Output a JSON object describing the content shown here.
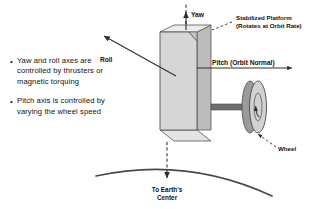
{
  "diagram": {
    "bullets": [
      {
        "marker": "•",
        "text": "Yaw and roll axes are controlled by thrusters or magnetic torquing"
      },
      {
        "marker": "•",
        "text": "Pitch axis is controlled by varying the wheel speed"
      }
    ],
    "axis_labels": {
      "yaw": "Yaw",
      "roll": "Roll",
      "pitch": "Pitch (Orbit Normal)"
    },
    "callouts": {
      "platform_line1": "Stabilized Platform",
      "platform_line2": "(Rotates at Orbit Rate)",
      "wheel": "Wheel"
    },
    "earth_label": {
      "line1": "To Earth's",
      "line2": "Center"
    },
    "colors": {
      "background": "#ffffff",
      "stroke": "#3a3a3a",
      "text": "#111111",
      "body_front": "#d6d6d6",
      "body_top": "#ececec",
      "body_side": "#bcbcbc",
      "body_bottom": "#e4e4e4",
      "wheel_face": "#d2d2d2",
      "wheel_rim": "#9a9a9a",
      "shaft": "#6e6e6e",
      "earth_arc": "#4a4a4a"
    }
  }
}
